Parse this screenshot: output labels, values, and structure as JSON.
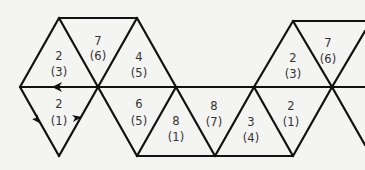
{
  "diagram": {
    "faces": [
      {
        "id": "f1",
        "orientation": "up",
        "top": "2",
        "bottom": "(3)",
        "cx": 59,
        "cy": 67
      },
      {
        "id": "f2",
        "orientation": "down",
        "top": "7",
        "bottom": "(6)",
        "cx": 98,
        "cy": 48
      },
      {
        "id": "f3",
        "orientation": "up",
        "top": "4",
        "bottom": "(5)",
        "cx": 137,
        "cy": 67
      },
      {
        "id": "f4",
        "orientation": "down",
        "top": "2",
        "bottom": "(1)",
        "cx": 59,
        "cy": 110
      },
      {
        "id": "f5",
        "orientation": "down",
        "top": "6",
        "bottom": "(5)",
        "cx": 137,
        "cy": 110
      },
      {
        "id": "f6",
        "orientation": "up",
        "top": "8",
        "bottom": "(1)",
        "cx": 176,
        "cy": 130
      },
      {
        "id": "f7",
        "orientation": "down",
        "top": "8",
        "bottom": "(7)",
        "cx": 215,
        "cy": 110
      },
      {
        "id": "f8",
        "orientation": "up",
        "top": "3",
        "bottom": "(4)",
        "cx": 254,
        "cy": 130
      },
      {
        "id": "f9",
        "orientation": "down",
        "top": "2",
        "bottom": "(1)",
        "cx": 293,
        "cy": 110
      },
      {
        "id": "f10",
        "orientation": "up",
        "top": "2",
        "bottom": "(3)",
        "cx": 293,
        "cy": 67
      },
      {
        "id": "f11",
        "orientation": "down",
        "top": "7",
        "bottom": "(6)",
        "cx": 332,
        "cy": 48
      }
    ],
    "arrows": [
      {
        "id": "arrow-left-on-midline",
        "direction": "left"
      },
      {
        "id": "arrow-down-left-edge",
        "direction": "down-right"
      },
      {
        "id": "arrow-up-right-edge",
        "direction": "up-right"
      }
    ],
    "stroke_color": "#111111",
    "label_color": "#333333",
    "background": "#f4f4f2"
  }
}
